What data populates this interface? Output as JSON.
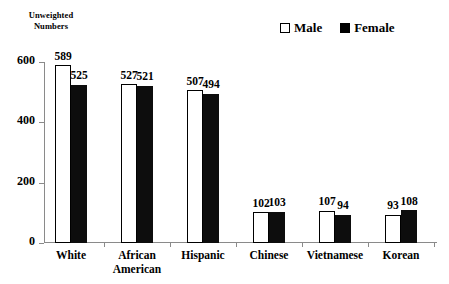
{
  "chart_data": {
    "type": "bar",
    "title": "",
    "ylabel": "Unweighted Numbers",
    "xlabel": "",
    "ylim": [
      0,
      600
    ],
    "yticks": [
      0,
      200,
      400,
      600
    ],
    "grid": false,
    "legend_position": "top-right",
    "categories": [
      "White",
      "African American",
      "Hispanic",
      "Chinese",
      "Vietnamese",
      "Korean"
    ],
    "category_lines": [
      [
        "White"
      ],
      [
        "African",
        "American"
      ],
      [
        "Hispanic"
      ],
      [
        "Chinese"
      ],
      [
        "Vietnamese"
      ],
      [
        "Korean"
      ]
    ],
    "series": [
      {
        "name": "Male",
        "color": "#ffffff",
        "values": [
          589,
          527,
          507,
          102,
          107,
          93
        ]
      },
      {
        "name": "Female",
        "color": "#000000",
        "values": [
          525,
          521,
          494,
          103,
          94,
          108
        ]
      }
    ]
  },
  "axis_title": {
    "line1": "Unweighted",
    "line2": "Numbers"
  },
  "legend": {
    "items": [
      {
        "label": "Male",
        "swatch": "hollow-square-icon"
      },
      {
        "label": "Female",
        "swatch": "filled-square-icon"
      }
    ]
  },
  "yticks": [
    "0",
    "200",
    "400",
    "600"
  ]
}
